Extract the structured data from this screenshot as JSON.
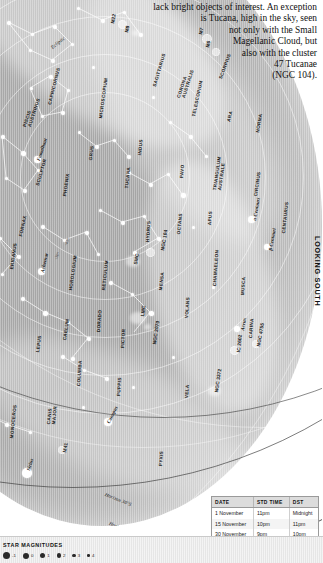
{
  "intro": {
    "lines": [
      "lack bright objects of interest. An exception",
      "is Tucana, high in the sky, seen",
      "not only with the Small",
      "Magellanic Cloud, but",
      "also with the cluster",
      "47 Tucanae",
      "(NGC 104)."
    ]
  },
  "orientation": {
    "looking": "LOOKING SOUTH"
  },
  "table": {
    "headers": [
      "DATE",
      "STD TIME",
      "DST"
    ],
    "rows": [
      [
        "1 November",
        "11pm",
        "Midnight"
      ],
      [
        "15 November",
        "10pm",
        "11pm"
      ],
      [
        "30 November",
        "9pm",
        "10pm"
      ]
    ]
  },
  "magnitudes": {
    "title": "STAR MAGNITUDES",
    "items": [
      {
        "label": "-1",
        "size": 7
      },
      {
        "label": "0",
        "size": 6
      },
      {
        "label": "1",
        "size": 5
      },
      {
        "label": "2",
        "size": 4.2
      },
      {
        "label": "3",
        "size": 3.4
      },
      {
        "label": "4",
        "size": 2.6
      }
    ]
  },
  "chart_data": {
    "type": "scatter",
    "constellations": [
      {
        "name": "SAGITTARIUS",
        "x": 152,
        "y": 86,
        "rot": -74
      },
      {
        "name": "CORONA",
        "x": 176,
        "y": 97,
        "rot": -72
      },
      {
        "name": "AUSTRALIS",
        "x": 181,
        "y": 97,
        "rot": -72
      },
      {
        "name": "SCORPIUS",
        "x": 218,
        "y": 78,
        "rot": -70
      },
      {
        "name": "TELESCOPIUM",
        "x": 191,
        "y": 116,
        "rot": -78
      },
      {
        "name": "ARA",
        "x": 226,
        "y": 121,
        "rot": -76
      },
      {
        "name": "NORMA",
        "x": 255,
        "y": 132,
        "rot": -80
      },
      {
        "name": "PISCIS",
        "x": 22,
        "y": 126,
        "rot": -72
      },
      {
        "name": "AUSTRINUS",
        "x": 27,
        "y": 126,
        "rot": -72
      },
      {
        "name": "CAPRICORNUS",
        "x": 47,
        "y": 104,
        "rot": -76
      },
      {
        "name": "MICROSCOPIUM",
        "x": 98,
        "y": 118,
        "rot": -82
      },
      {
        "name": "GRUS",
        "x": 88,
        "y": 160,
        "rot": -84
      },
      {
        "name": "INDUS",
        "x": 137,
        "y": 155,
        "rot": -84
      },
      {
        "name": "SCULPTOR",
        "x": 35,
        "y": 185,
        "rot": -74
      },
      {
        "name": "PHOENIX",
        "x": 62,
        "y": 196,
        "rot": -82
      },
      {
        "name": "TUCANA",
        "x": 124,
        "y": 188,
        "rot": -84
      },
      {
        "name": "PAVO",
        "x": 179,
        "y": 178,
        "rot": -86
      },
      {
        "name": "TRIANGULUM",
        "x": 212,
        "y": 190,
        "rot": -82
      },
      {
        "name": "AUSTRALE",
        "x": 217,
        "y": 190,
        "rot": -82
      },
      {
        "name": "APUS",
        "x": 207,
        "y": 225,
        "rot": -86
      },
      {
        "name": "CIRCINUS",
        "x": 253,
        "y": 196,
        "rot": -82
      },
      {
        "name": "CENTAURUS",
        "x": 281,
        "y": 233,
        "rot": -84
      },
      {
        "name": "FORNAX",
        "x": 18,
        "y": 236,
        "rot": -78
      },
      {
        "name": "ERIDANUS",
        "x": 9,
        "y": 269,
        "rot": -82
      },
      {
        "name": "HYDRUS",
        "x": 145,
        "y": 242,
        "rot": -86
      },
      {
        "name": "OCTANS",
        "x": 176,
        "y": 234,
        "rot": -84
      },
      {
        "name": "HOROLOGIUM",
        "x": 68,
        "y": 290,
        "rot": -82
      },
      {
        "name": "RETICULUM",
        "x": 101,
        "y": 290,
        "rot": -84
      },
      {
        "name": "DORADO",
        "x": 96,
        "y": 332,
        "rot": -86
      },
      {
        "name": "MENSA",
        "x": 158,
        "y": 290,
        "rot": -84
      },
      {
        "name": "CHAMAELEON",
        "x": 212,
        "y": 286,
        "rot": -86
      },
      {
        "name": "MUSCA",
        "x": 240,
        "y": 295,
        "rot": -86
      },
      {
        "name": "VOLANS",
        "x": 184,
        "y": 318,
        "rot": -86
      },
      {
        "name": "CARINA",
        "x": 248,
        "y": 338,
        "rot": -86
      },
      {
        "name": "PICTOR",
        "x": 120,
        "y": 348,
        "rot": -86
      },
      {
        "name": "CAELUM",
        "x": 62,
        "y": 340,
        "rot": -82
      },
      {
        "name": "LEPUS",
        "x": 35,
        "y": 352,
        "rot": -82
      },
      {
        "name": "COLUMBA",
        "x": 76,
        "y": 386,
        "rot": -86
      },
      {
        "name": "CANIS",
        "x": 46,
        "y": 424,
        "rot": -84
      },
      {
        "name": "MAJOR",
        "x": 51,
        "y": 424,
        "rot": -84
      },
      {
        "name": "PUPPIS",
        "x": 116,
        "y": 396,
        "rot": -86
      },
      {
        "name": "VELA",
        "x": 184,
        "y": 398,
        "rot": -86
      },
      {
        "name": "MONOCEROS",
        "x": 9,
        "y": 438,
        "rot": -84
      },
      {
        "name": "PYXIS",
        "x": 158,
        "y": 466,
        "rot": -86
      }
    ],
    "named_stars": [
      {
        "name": "Fomalhaut",
        "x": 36,
        "y": 160,
        "rot": -72,
        "mag": 1.2
      },
      {
        "name": "Achernar",
        "x": 40,
        "y": 272,
        "rot": -78,
        "mag": 0.5
      },
      {
        "name": "Canopus",
        "x": 106,
        "y": 422,
        "rot": -64,
        "mag": -0.7
      },
      {
        "name": "Sirius",
        "x": 26,
        "y": 470,
        "rot": -74,
        "mag": -1.4
      },
      {
        "name": "α Centauri",
        "x": 252,
        "y": 220,
        "rot": -80,
        "mag": 0.0
      },
      {
        "name": "β Centauri",
        "x": 268,
        "y": 250,
        "rot": -80,
        "mag": 0.6
      },
      {
        "name": "Acrux",
        "x": 240,
        "y": 330,
        "rot": -80,
        "mag": 0.8
      }
    ],
    "deep_sky_objects": [
      {
        "name": "M22",
        "x": 110,
        "y": 23,
        "rot": -78,
        "kind": "cluster"
      },
      {
        "name": "M8",
        "x": 124,
        "y": 32,
        "rot": -78,
        "kind": "nebula"
      },
      {
        "name": "M7",
        "x": 198,
        "y": 34,
        "rot": -78,
        "kind": "cluster"
      },
      {
        "name": "M6",
        "x": 205,
        "y": 47,
        "rot": -78,
        "kind": "cluster"
      },
      {
        "name": "SMC",
        "x": 133,
        "y": 264,
        "rot": -80,
        "kind": "galaxy"
      },
      {
        "name": "NGC 104",
        "x": 160,
        "y": 250,
        "rot": -80,
        "kind": "cluster"
      },
      {
        "name": "LMC",
        "x": 140,
        "y": 316,
        "rot": -82,
        "kind": "galaxy"
      },
      {
        "name": "NGC 2070",
        "x": 152,
        "y": 344,
        "rot": -82,
        "kind": "nebula"
      },
      {
        "name": "IC 2602",
        "x": 236,
        "y": 352,
        "rot": -84,
        "kind": "cluster"
      },
      {
        "name": "NGC 4755",
        "x": 256,
        "y": 346,
        "rot": -80,
        "kind": "cluster"
      },
      {
        "name": "NGC 3372",
        "x": 214,
        "y": 392,
        "rot": -82,
        "kind": "nebula"
      },
      {
        "name": "M41",
        "x": 62,
        "y": 452,
        "rot": -80,
        "kind": "cluster"
      }
    ],
    "grid_labels": [
      {
        "name": "-30°",
        "x": 53,
        "y": 258,
        "rot": -64
      },
      {
        "name": "-45°",
        "x": 63,
        "y": 244,
        "rot": -64
      }
    ],
    "horizon_labels": [
      {
        "name": "Horizon 30°S",
        "x": 106,
        "y": 492,
        "rot": 22
      },
      {
        "name": "Horizon 42°S",
        "x": 110,
        "y": 521,
        "rot": 20
      }
    ],
    "ecliptic_label": {
      "name": "Ecliptic",
      "x": 50,
      "y": 46,
      "rot": -38
    }
  }
}
